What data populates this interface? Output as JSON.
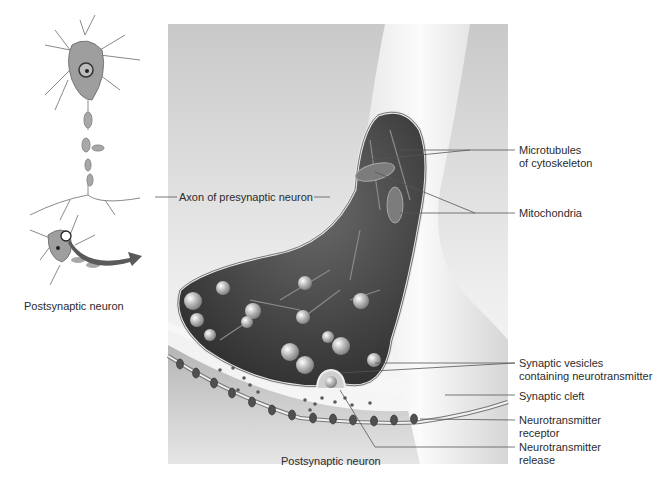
{
  "diagram": {
    "type": "anatomical-illustration",
    "inset": {
      "label": "Postsynaptic neuron",
      "callout": "Axon of presynaptic neuron"
    },
    "labels": {
      "microtubules": [
        "Microtubules",
        "of cytoskeleton"
      ],
      "mitochondria": "Mitochondria",
      "vesicles": [
        "Synaptic vesicles",
        "containing neurotransmitter"
      ],
      "cleft": "Synaptic cleft",
      "receptor": [
        "Neurotransmitter",
        "receptor"
      ],
      "release": [
        "Neurotransmitter",
        "release"
      ],
      "postsynaptic_bottom": "Postsynaptic neuron"
    },
    "colors": {
      "arrow": "#5a5a5a",
      "terminal_interior": "#4a4a4a",
      "background_panel": "#d9d9d9",
      "label_line": "#555555"
    }
  }
}
